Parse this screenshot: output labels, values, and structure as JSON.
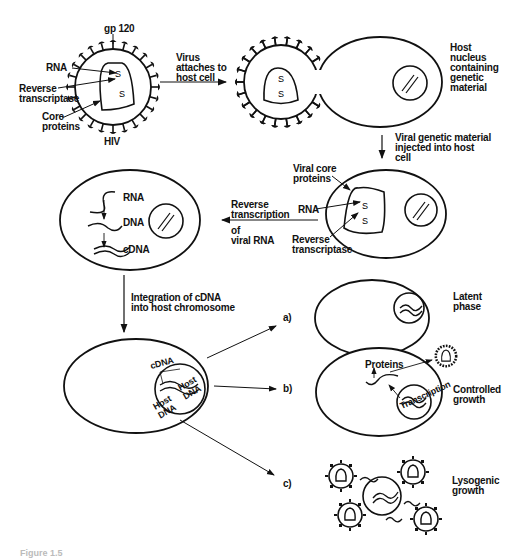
{
  "diagram": {
    "colors": {
      "ink": "#111111",
      "background": "#ffffff"
    },
    "virus": {
      "name": "HIV",
      "labels": {
        "gp120": "gp 120",
        "rna": "RNA",
        "reverse_transcriptase": "Reverse\ntranscriptase",
        "core_proteins": "Core\nproteins"
      }
    },
    "steps": {
      "attach": "Virus\nattaches to\nhost cell",
      "host_nucleus": "Host\nnucleus\ncontaining\ngenetic\nmaterial",
      "inject": "Viral genetic material\ninjected into host\ncell",
      "viral_core_proteins": "Viral core\nproteins",
      "rna": "RNA",
      "reverse_transcriptase": "Reverse\ntranscriptase",
      "reverse_transcription": "Reverse\ntranscription",
      "of_viral_rna": "of\nviral RNA",
      "rt_rna": "RNA",
      "rt_dna": "DNA",
      "rt_cdna": "cDNA",
      "integration": "Integration of cDNA\ninto host chromosome",
      "cdna": "cDNA",
      "host_dna_left": "Host\nDNA",
      "host_dna_right": "Host\nDNA"
    },
    "outcomes": [
      {
        "marker": "a)",
        "label": "Latent\nphase"
      },
      {
        "marker": "b)",
        "label": "Controlled\ngrowth",
        "proteins": "Proteins",
        "transcription": "Transcription"
      },
      {
        "marker": "c)",
        "label": "Lysogenic\ngrowth"
      }
    ],
    "caption": "Figure 1.5"
  }
}
